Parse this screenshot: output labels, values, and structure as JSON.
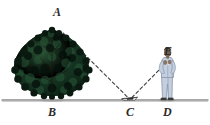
{
  "figure": {
    "kind": "mirror-tree-height-diagram",
    "background_color": "#ffffff",
    "width": 210,
    "height": 125
  },
  "labels": {
    "a": "A",
    "b": "B",
    "c": "C",
    "d": "D",
    "e": "E"
  },
  "points": {
    "a": {
      "label": "A",
      "x": 57,
      "y": 13,
      "meaning": "tree-top"
    },
    "b": {
      "label": "B",
      "x": 52,
      "y": 113,
      "meaning": "tree-base"
    },
    "c": {
      "label": "C",
      "x": 130,
      "y": 114,
      "meaning": "mirror-on-ground"
    },
    "d": {
      "label": "D",
      "x": 167,
      "y": 114,
      "meaning": "observer-feet"
    },
    "e": {
      "label": "E",
      "x": 168,
      "y": 53,
      "meaning": "observer-eye"
    }
  },
  "elements": {
    "ground_line": {
      "name": "ground-line",
      "color": "#8c8c8c",
      "y": 100,
      "x_start": 2,
      "x_end": 208
    },
    "tree": {
      "name": "tree",
      "canopy_color": "#14301f",
      "canopy_dark": "#0a1b12",
      "canopy_highlight": "#2f5c3c",
      "trunk_color": "#2a211c",
      "base_x": 52,
      "top_y": 28
    },
    "mirror": {
      "name": "mirror",
      "color": "#1a1a1a",
      "outline": "#4a4a4a",
      "x": 130,
      "y": 99
    },
    "person": {
      "name": "observer-person",
      "suit_color": "#c3cede",
      "suit_shadow": "#8e9cb2",
      "skin_color": "#7d6a5a",
      "hair_color": "#3a3129",
      "shoe_color": "#3a3a3a"
    },
    "sight_line_tree": {
      "name": "sight-line-tree-to-mirror",
      "style": "dashed",
      "color": "#3c3c3c",
      "from": "A",
      "to": "C"
    },
    "sight_line_eye": {
      "name": "sight-line-mirror-to-eye",
      "style": "dashed",
      "color": "#3c3c3c",
      "from": "C",
      "to": "E"
    }
  }
}
